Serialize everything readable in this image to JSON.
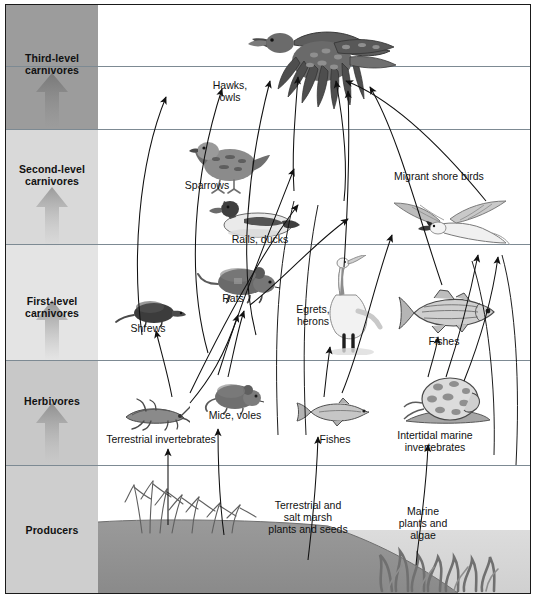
{
  "figure": {
    "kind": "salt-marsh-food-web-diagram",
    "trophic_levels": [
      {
        "id": "third-level-carnivores",
        "label": "Third-level\ncarnivores",
        "band_color": "#9c9c9c",
        "top": 0,
        "height": 124
      },
      {
        "id": "second-level-carnivores",
        "label": "Second-level\ncarnivores",
        "band_color": "#d6d6d6",
        "top": 124,
        "height": 115
      },
      {
        "id": "first-level-carnivores",
        "label": "First-level\ncarnivores",
        "band_color": "#e2e2e2",
        "top": 239,
        "height": 116
      },
      {
        "id": "herbivores",
        "label": "Herbivores",
        "band_color": "#c9c9c9",
        "top": 355,
        "height": 105
      },
      {
        "id": "producers",
        "label": "Producers",
        "band_color": "#cfcfcf",
        "top": 460,
        "height": 128
      }
    ],
    "organisms": [
      {
        "id": "hawks-owls",
        "label": "Hawks,\nowls",
        "level": "third-level-carnivores"
      },
      {
        "id": "sparrows",
        "label": "Sparrows",
        "level": "second-level-carnivores"
      },
      {
        "id": "rails-ducks",
        "label": "Rails, ducks",
        "level": "second-level-carnivores"
      },
      {
        "id": "migrant-shore-birds",
        "label": "Migrant shore birds",
        "level": "second-level-carnivores"
      },
      {
        "id": "shrews",
        "label": "Shrews",
        "level": "first-level-carnivores"
      },
      {
        "id": "rats",
        "label": "Rats",
        "level": "first-level-carnivores"
      },
      {
        "id": "egrets-herons",
        "label": "Egrets,\nherons",
        "level": "first-level-carnivores"
      },
      {
        "id": "fishes-carnivore",
        "label": "Fishes",
        "level": "first-level-carnivores"
      },
      {
        "id": "terrestrial-invertebrates",
        "label": "Terrestrial invertebrates",
        "level": "herbivores"
      },
      {
        "id": "mice-voles",
        "label": "Mice, voles",
        "level": "herbivores"
      },
      {
        "id": "fishes-herbivore",
        "label": "Fishes",
        "level": "herbivores"
      },
      {
        "id": "intertidal-marine-invertebrates",
        "label": "Intertidal marine\ninvertebrates",
        "level": "herbivores"
      },
      {
        "id": "terrestrial-salt-marsh-plants",
        "label": "Terrestrial and\nsalt marsh\nplants and seeds",
        "level": "producers"
      },
      {
        "id": "marine-plants-algae",
        "label": "Marine\nplants and\nalgae",
        "level": "producers"
      }
    ],
    "colors": {
      "frame": "#1a1a1a",
      "row_divider": "#7d8a93",
      "arrow": "#111111",
      "band_arrow": "#8c8c8c",
      "upland_soil": "#8e8e8e",
      "water": "#d3d3d3",
      "text": "#111111"
    }
  }
}
